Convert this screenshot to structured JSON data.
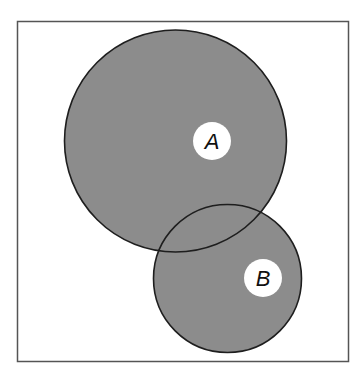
{
  "diagram": {
    "type": "venn",
    "frame": {
      "x": 17,
      "y": 21,
      "width": 331,
      "height": 340,
      "stroke": "#555555"
    },
    "fill_color": "#8c8c8c",
    "stroke_color": "#1e1e1e",
    "sets": [
      {
        "label": "A",
        "cx": 175.5,
        "cy": 141,
        "r": 111,
        "label_x": 212,
        "label_y": 141,
        "label_r": 19
      },
      {
        "label": "B",
        "cx": 227.5,
        "cy": 278.5,
        "r": 74,
        "label_x": 263,
        "label_y": 278,
        "label_r": 19
      }
    ]
  }
}
